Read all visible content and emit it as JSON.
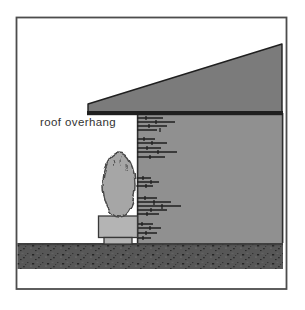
{
  "figure": {
    "labels": {
      "roof_overhang": "roof overhang"
    }
  },
  "colors": {
    "background": "#ffffff",
    "frame": "#4d4d4d",
    "roof": "#7b7b7b",
    "roof_edge": "#1f1f1f",
    "wall": "#909090",
    "wall_edge": "#2e2e2e",
    "brick": "#1f1f1f",
    "ground": "#575757",
    "ground_top": "#3a3a3a",
    "ground_speckle": "#1c1c1c",
    "shrub": "#a6a6a6",
    "shrub_edge": "#4a4a4a",
    "planter": "#b4b4b4",
    "planter_edge": "#383838",
    "label": "#333333"
  }
}
